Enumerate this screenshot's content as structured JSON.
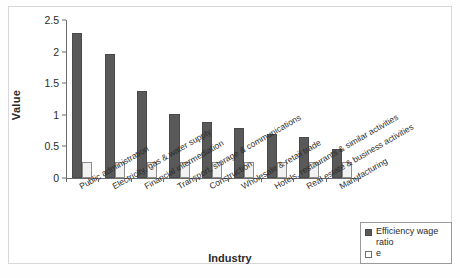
{
  "chart_data": {
    "type": "bar",
    "title": "",
    "xlabel": "Industry",
    "ylabel": "Value",
    "ylim": [
      0,
      2.5
    ],
    "yticks": [
      "0",
      "0.5",
      "1",
      "1.5",
      "2",
      "2.5"
    ],
    "ytick_values": [
      0,
      0.5,
      1,
      1.5,
      2,
      2.5
    ],
    "grid": false,
    "legend_position": "bottom-right",
    "categories": [
      "Public administration",
      "Electricity, gas & water supply",
      "Financial intermediation",
      "Transport, storage & communications",
      "Construction",
      "Wholesale & retail trade",
      "Hotels, restaurants & similar activities",
      "Real estate & business activities",
      "Manufacturing"
    ],
    "series": [
      {
        "name": "Efficiency wage ratio",
        "color": "#595959",
        "values": [
          2.3,
          1.96,
          1.37,
          1.02,
          0.89,
          0.79,
          0.69,
          0.65,
          0.46
        ]
      },
      {
        "name": "e",
        "color": "#f2f2f2",
        "values": [
          0.25,
          0.25,
          0.25,
          0.25,
          0.25,
          0.25,
          0.25,
          0.25,
          0.25
        ]
      }
    ]
  },
  "legend": {
    "items": [
      {
        "label": "Efficiency wage ratio"
      },
      {
        "label": "e"
      }
    ]
  }
}
